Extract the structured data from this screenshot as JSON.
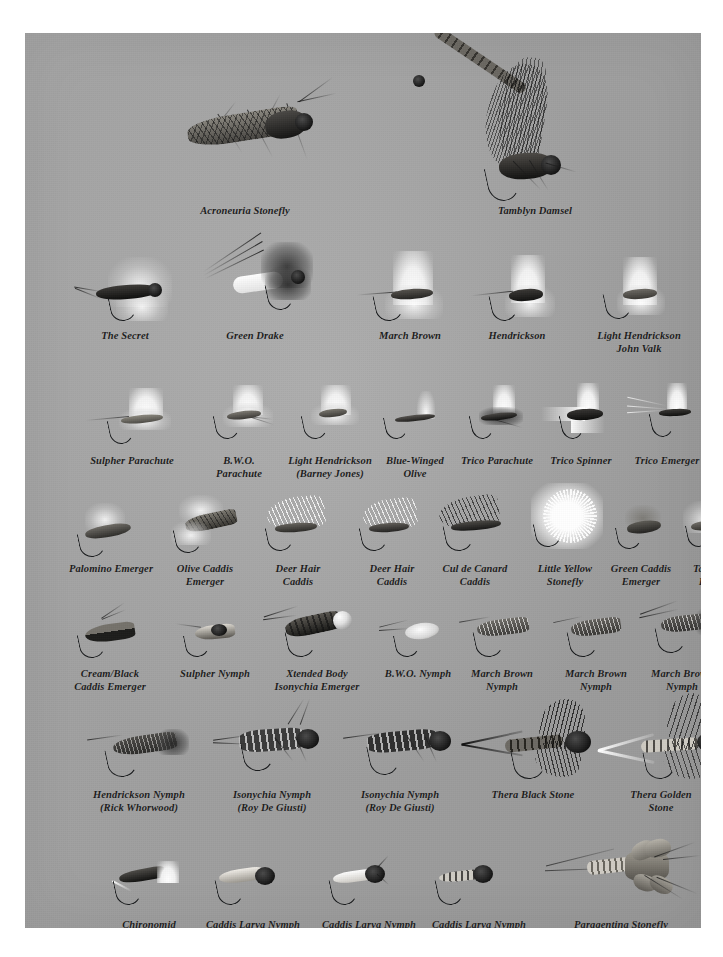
{
  "page": {
    "background_color": "#ffffff",
    "plate_background_color": "#a9a9a9",
    "caption_color": "#1b1b1b"
  },
  "rows": [
    {
      "id": "row-1",
      "flies": [
        {
          "name": "Acroneuria Stonefly",
          "caption": "Acroneuria Stonefly",
          "type": "stonefly-adult"
        },
        {
          "name": "Tamblyn Damsel",
          "caption": "Tamblyn Damsel",
          "type": "damselfly-adult"
        }
      ]
    },
    {
      "id": "row-2",
      "flies": [
        {
          "name": "The Secret",
          "caption": "The Secret",
          "type": "dry-fly"
        },
        {
          "name": "Green Drake",
          "caption": "Green Drake",
          "type": "dry-fly"
        },
        {
          "name": "March Brown",
          "caption": "March Brown",
          "type": "dry-fly"
        },
        {
          "name": "Hendrickson",
          "caption": "Hendrickson",
          "type": "dry-fly"
        },
        {
          "name": "Light Hendrickson John Valk",
          "caption": "Light Hendrickson\nJohn Valk",
          "type": "dry-fly"
        }
      ]
    },
    {
      "id": "row-3",
      "flies": [
        {
          "name": "Sulpher Parachute",
          "caption": "Sulpher Parachute",
          "type": "parachute"
        },
        {
          "name": "B.W.O. Parachute",
          "caption": "B.W.O.\nParachute",
          "type": "parachute"
        },
        {
          "name": "Light Hendrickson (Barney Jones)",
          "caption": "Light Hendrickson\n(Barney Jones)",
          "type": "parachute"
        },
        {
          "name": "Blue-Winged Olive",
          "caption": "Blue-Winged\nOlive",
          "type": "dry-fly-small"
        },
        {
          "name": "Trico Parachute",
          "caption": "Trico Parachute",
          "type": "parachute-small"
        },
        {
          "name": "Trico Spinner",
          "caption": "Trico Spinner",
          "type": "spinner"
        },
        {
          "name": "Trico Emerger",
          "caption": "Trico Emerger",
          "type": "emerger"
        }
      ]
    },
    {
      "id": "row-4",
      "flies": [
        {
          "name": "Palomino Emerger",
          "caption": "Palomino Emerger",
          "type": "caddis"
        },
        {
          "name": "Olive Caddis Emerger",
          "caption": "Olive Caddis\nEmerger",
          "type": "caddis"
        },
        {
          "name": "Deer Hair Caddis",
          "caption": "Deer Hair\nCaddis",
          "type": "caddis"
        },
        {
          "name": "Deer Hair Caddis 2",
          "caption": "Deer Hair\nCaddis",
          "type": "caddis"
        },
        {
          "name": "Cul de Canard Caddis",
          "caption": "Cul de Canard\nCaddis",
          "type": "caddis-dark"
        },
        {
          "name": "Little Yellow Stonefly",
          "caption": "Little Yellow\nStonefly",
          "type": "stonefly-dry"
        },
        {
          "name": "Green Caddis Emerger",
          "caption": "Green Caddis\nEmerger",
          "type": "emerger-small"
        },
        {
          "name": "Tan Caddis Emerger",
          "caption": "Tan Caddis\nEmerger",
          "type": "emerger-small"
        }
      ]
    },
    {
      "id": "row-5",
      "flies": [
        {
          "name": "Cream/Black Caddis Emerger",
          "caption": "Cream/Black\nCaddis Emerger",
          "type": "nymph"
        },
        {
          "name": "Sulpher Nymph",
          "caption": "Sulpher Nymph",
          "type": "nymph-small"
        },
        {
          "name": "Xtended Body Isonychia Emerger",
          "caption": "Xtended Body\nIsonychia Emerger",
          "type": "nymph-bead"
        },
        {
          "name": "B.W.O. Nymph",
          "caption": "B.W.O. Nymph",
          "type": "nymph-small"
        },
        {
          "name": "March Brown Nymph",
          "caption": "March Brown\nNymph",
          "type": "nymph"
        },
        {
          "name": "March Brown Nymph 2",
          "caption": "March Brown\nNymph",
          "type": "nymph"
        },
        {
          "name": "March Brown Nymph 3",
          "caption": "March Brown\nNymph",
          "type": "nymph-tailed"
        }
      ]
    },
    {
      "id": "row-6",
      "flies": [
        {
          "name": "Hendrickson Nymph (Rick Whorwood)",
          "caption": "Hendrickson Nymph\n(Rick Whorwood)",
          "type": "nymph"
        },
        {
          "name": "Isonychia Nymph (Roy De Giusti)",
          "caption": "Isonychia Nymph\n(Roy De Giusti)",
          "type": "realistic-nymph"
        },
        {
          "name": "Isonychia Nymph (Roy De Giusti) 2",
          "caption": "Isonychia Nymph\n(Roy De Giusti)",
          "type": "realistic-nymph"
        },
        {
          "name": "Thera Black Stone",
          "caption": "Thera Black Stone",
          "type": "stone-nymph-black"
        },
        {
          "name": "Thera Golden Stone",
          "caption": "Thera Golden\nStone",
          "type": "stone-nymph-golden"
        }
      ]
    },
    {
      "id": "row-7",
      "flies": [
        {
          "name": "Chironomid (Joe Penich)",
          "caption": "Chironomid\n(Joe Penich)",
          "type": "chironomid"
        },
        {
          "name": "Caddis Larva Nymph",
          "caption": "Caddis Larva Nymph",
          "type": "larva"
        },
        {
          "name": "Caddis Larva Nymph 2",
          "caption": "Caddis Larva Nymph",
          "type": "larva"
        },
        {
          "name": "Caddis Larva Nymph 3",
          "caption": "Caddis Larva Nymph",
          "type": "larva"
        },
        {
          "name": "Paragentina Stonefly Nymph",
          "caption": "Paragentina Stonefly\nNymph",
          "type": "realistic-stone"
        }
      ]
    }
  ]
}
